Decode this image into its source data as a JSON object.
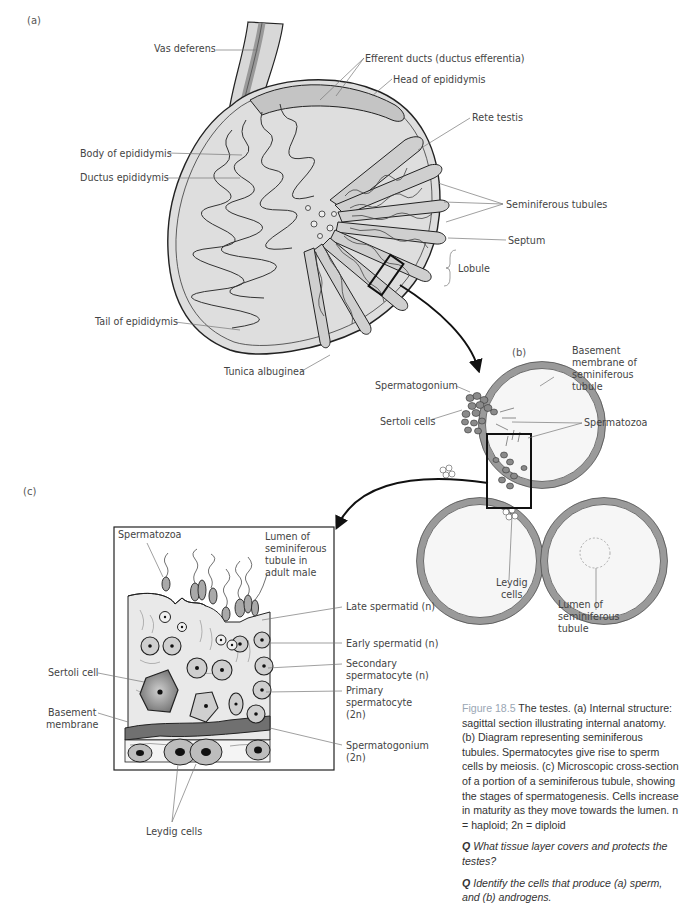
{
  "figure": {
    "panels": {
      "a": "(a)",
      "b": "(b)",
      "c": "(c)"
    },
    "panel_a_labels": {
      "vas_deferens": "Vas deferens",
      "efferent_ducts": "Efferent ducts (ductus efferentia)",
      "head_of_epididymis": "Head of epididymis",
      "rete_testis": "Rete testis",
      "body_of_epididymis": "Body of epididymis",
      "ductus_epididymis": "Ductus epididymis",
      "seminiferous_tubules": "Seminiferous tubules",
      "septum": "Septum",
      "lobule": "Lobule",
      "tail_of_epididymis": "Tail of epididymis",
      "tunica_albuginea": "Tunica albuginea"
    },
    "panel_b_labels": {
      "basement_membrane_1": "Basement",
      "basement_membrane_2": "membrane of",
      "basement_membrane_3": "seminiferous",
      "basement_membrane_4": "tubule",
      "spermatogonium": "Spermatogonium",
      "sertoli_cells": "Sertoli cells",
      "spermatozoa": "Spermatozoa",
      "leydig_cells_1": "Leydig",
      "leydig_cells_2": "cells",
      "lumen_1": "Lumen of",
      "lumen_2": "seminiferous",
      "lumen_3": "tubule"
    },
    "panel_c_labels": {
      "spermatozoa": "Spermatozoa",
      "lumen_1": "Lumen of",
      "lumen_2": "seminiferous",
      "lumen_3": "tubule in",
      "lumen_4": "adult male",
      "late_spermatid": "Late spermatid (n)",
      "early_spermatid": "Early spermatid (n)",
      "secondary_spermatocyte_1": "Secondary",
      "secondary_spermatocyte_2": "spermatocyte (n)",
      "primary_spermatocyte_1": "Primary",
      "primary_spermatocyte_2": "spermatocyte",
      "primary_spermatocyte_3": "(2n)",
      "spermatogonium_1": "Spermatogonium",
      "spermatogonium_2": "(2n)",
      "sertoli_cell": "Sertoli cell",
      "basement_membrane_1": "Basement",
      "basement_membrane_2": "membrane",
      "leydig_cells": "Leydig cells"
    },
    "colors": {
      "tissue_light": "#dcdcdc",
      "tissue_mid": "#b5b5b5",
      "tissue_dark": "#7d7d7d",
      "outline": "#222222",
      "caption_figure_number": "#9aa6b4"
    }
  },
  "caption": {
    "figure_number": "Figure 18.5",
    "text": " The testes. (a) Internal structure: sagittal section illustrating internal anatomy. (b) Diagram representing seminiferous tubules. Spermatocytes give rise to sperm cells by meiosis. (c) Microscopic cross-section of a portion of a seminiferous tubule, showing the stages of spermatogenesis. Cells increase in maturity as they move towards the lumen. n = haploid; 2n = diploid",
    "question_1_marker": "Q",
    "question_1": " What tissue layer covers and protects the testes?",
    "question_2_marker": "Q",
    "question_2": " Identify the cells that produce (a) sperm, and (b) androgens."
  }
}
